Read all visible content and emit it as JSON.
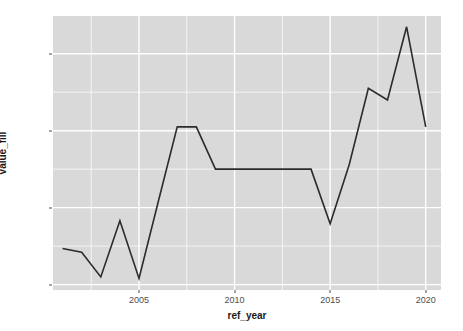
{
  "chart_data": {
    "type": "line",
    "title": "",
    "subtitle": "",
    "xlabel": "ref_year",
    "ylabel": "value_fill",
    "x": [
      2001,
      2002,
      2003,
      2004,
      2005,
      2006,
      2007,
      2008,
      2009,
      2010,
      2011,
      2012,
      2013,
      2014,
      2015,
      2016,
      2017,
      2018,
      2019,
      2020
    ],
    "values": [
      4470,
      4420,
      4100,
      4830,
      4080,
      5070,
      6050,
      6050,
      5500,
      5500,
      5500,
      5500,
      5500,
      5500,
      4790,
      5560,
      6550,
      6400,
      7350,
      6050
    ],
    "series": [
      {
        "name": "value_fill",
        "values": [
          4470,
          4420,
          4100,
          4830,
          4080,
          5070,
          6050,
          6050,
          5500,
          5500,
          5500,
          5500,
          5500,
          5500,
          4790,
          5560,
          6550,
          6400,
          7350,
          6050
        ]
      }
    ],
    "xlim": [
      2000.5,
      2020.8
    ],
    "ylim": [
      3930,
      7490
    ],
    "xticks": [
      2005,
      2010,
      2015,
      2020
    ],
    "xtick_labels": [
      "2005",
      "2010",
      "2015",
      "2020"
    ],
    "yticks": [
      4000,
      5000,
      6000,
      7000
    ],
    "ytick_labels": [
      "4000",
      "5000",
      "6000",
      "7000"
    ],
    "x_minor_ticks": [
      2002.5,
      2007.5,
      2012.5,
      2017.5
    ],
    "y_minor_ticks": [
      4500,
      5500,
      6500
    ],
    "grid": true,
    "legend": false,
    "legend_position": "none",
    "line_color": "#2b2b2b",
    "line_width": 1.6,
    "panel_background": "#d9d9d9",
    "grid_color": "#ffffff",
    "plot_background": "#ffffff",
    "text_color": "#4d4d4d",
    "title_color": "#1a1a1a"
  }
}
